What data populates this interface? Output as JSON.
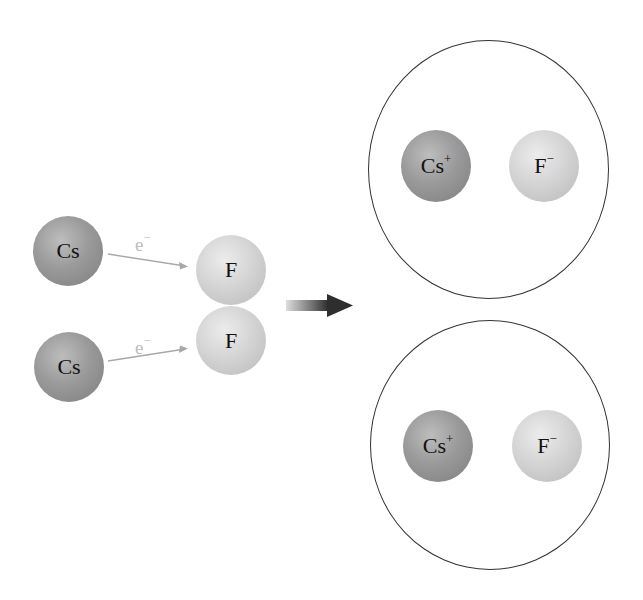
{
  "diagram": {
    "title": "",
    "reactants": {
      "cesium_atoms": [
        {
          "label": "Cs"
        },
        {
          "label": "Cs"
        }
      ],
      "fluorine_molecule": [
        {
          "label": "F"
        },
        {
          "label": "F"
        }
      ],
      "electron_transfers": [
        {
          "label": "e",
          "charge": "−"
        },
        {
          "label": "e",
          "charge": "−"
        }
      ]
    },
    "reaction_arrow": "right-arrow",
    "products": [
      {
        "cation": {
          "symbol": "Cs",
          "charge": "+"
        },
        "anion": {
          "symbol": "F",
          "charge": "−"
        }
      },
      {
        "cation": {
          "symbol": "Cs",
          "charge": "+"
        },
        "anion": {
          "symbol": "F",
          "charge": "−"
        }
      }
    ],
    "colors": {
      "cesium": "#959595",
      "fluorine": "#d0d0d0",
      "electron_arrow": "#aaaaaa",
      "reaction_arrow": "#333333",
      "ring": "#333333"
    }
  }
}
